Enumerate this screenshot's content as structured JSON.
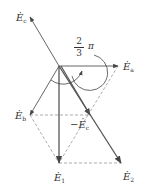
{
  "diagram": {
    "type": "phasor-diagram",
    "origin": [
      59,
      66
    ],
    "colors": {
      "line": "#555555",
      "dashed": "#888888",
      "text": "#333333"
    },
    "labels": {
      "Ea": {
        "base": "E",
        "sub": "a"
      },
      "Eb": {
        "base": "E",
        "sub": "b"
      },
      "Ec": {
        "base": "E",
        "sub": "c"
      },
      "neg_Ec": {
        "prefix": "−",
        "base": "E",
        "sub": "c"
      },
      "E1": {
        "base": "E",
        "sub": "1"
      },
      "E2": {
        "base": "E",
        "sub": "2"
      }
    },
    "angle": {
      "numerator": "2",
      "denominator": "3",
      "symbol": "π"
    },
    "vectors": [
      {
        "name": "Ea",
        "from": [
          59,
          66
        ],
        "to": [
          118,
          66
        ]
      },
      {
        "name": "Eb",
        "from": [
          59,
          66
        ],
        "to": [
          30,
          115
        ]
      },
      {
        "name": "Ec",
        "from": [
          59,
          66
        ],
        "to": [
          30,
          17
        ]
      },
      {
        "name": "neg_Ec",
        "from": [
          59,
          66
        ],
        "to": [
          88,
          115
        ]
      },
      {
        "name": "E1",
        "from": [
          59,
          66
        ],
        "to": [
          59,
          163
        ]
      },
      {
        "name": "E2",
        "from": [
          59,
          66
        ],
        "to": [
          121,
          163
        ]
      }
    ]
  }
}
